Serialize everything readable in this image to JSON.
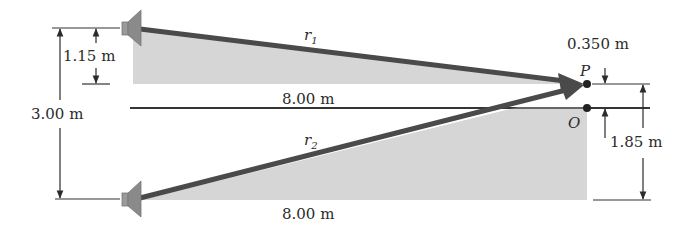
{
  "diagram": {
    "colors": {
      "shade": "#d4d4d4",
      "ray": "#4a4a4a",
      "line": "#333333",
      "speaker": "#8a8a8a"
    },
    "labels": {
      "r1": "r",
      "r1_sub": "1",
      "r2": "r",
      "r2_sub": "2",
      "center_distance": "8.00 m",
      "bottom_distance": "8.00 m",
      "speaker_separation": "3.00 m",
      "top_offset": "1.15 m",
      "p_offset": "0.350 m",
      "bottom_offset": "1.85 m",
      "point_p": "P",
      "point_o": "O"
    },
    "speakers": [
      {
        "name": "top-speaker",
        "y": 28
      },
      {
        "name": "bottom-speaker",
        "y": 199
      }
    ]
  }
}
